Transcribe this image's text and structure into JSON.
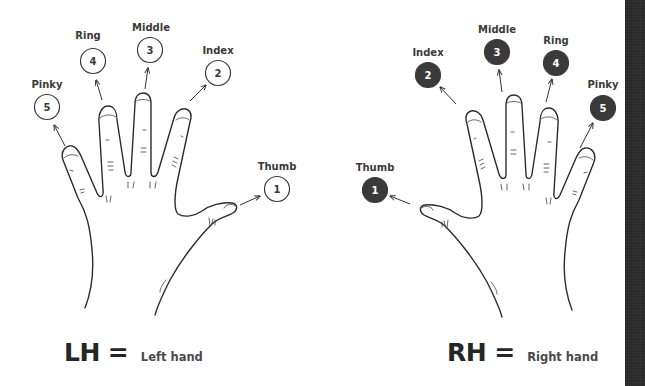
{
  "left_hand": {
    "fingers": [
      {
        "name": "Thumb",
        "number": "1"
      },
      {
        "name": "Index",
        "number": "2"
      },
      {
        "name": "Middle",
        "number": "3"
      },
      {
        "name": "Ring",
        "number": "4"
      },
      {
        "name": "Pinky",
        "number": "5"
      }
    ],
    "legend": {
      "abbr": "LH",
      "equals": "=",
      "description": "Left hand"
    },
    "circle_style": "outlined"
  },
  "right_hand": {
    "fingers": [
      {
        "name": "Thumb",
        "number": "1"
      },
      {
        "name": "Index",
        "number": "2"
      },
      {
        "name": "Middle",
        "number": "3"
      },
      {
        "name": "Ring",
        "number": "4"
      },
      {
        "name": "Pinky",
        "number": "5"
      }
    ],
    "legend": {
      "abbr": "RH",
      "equals": "=",
      "description": "Right hand"
    },
    "circle_style": "filled"
  },
  "colors": {
    "ink": "#3a3a3a",
    "background": "#ffffff",
    "side_strip": "#2e2e2e"
  }
}
